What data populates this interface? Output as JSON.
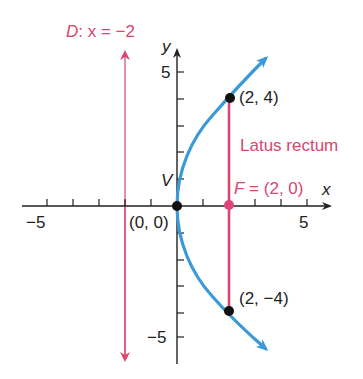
{
  "diagram": {
    "type": "parabola",
    "equation": "y^2 = 8x",
    "colors": {
      "parabola": "#3A9AD9",
      "directrix": "#D9466F",
      "latus_rectum": "#D9466F",
      "axes": "#222222",
      "points": "#111111",
      "focus": "#E0457A"
    },
    "axes": {
      "x_label": "x",
      "y_label": "y",
      "x_tick_labels": {
        "neg": "−5",
        "pos": "5"
      },
      "y_tick_labels": {
        "pos": "5",
        "neg": "−5"
      },
      "x_range": [
        -6,
        6
      ],
      "y_range": [
        -6,
        6
      ]
    },
    "labels": {
      "directrix_prefix": "D",
      "directrix_eq": ": x = −2",
      "vertex_letter": "V",
      "vertex_coords": "(0, 0)",
      "focus_prefix": "F",
      "focus_eq": " = (2, 0)",
      "latus_rectum": "Latus rectum",
      "point_top": "(2, 4)",
      "point_bottom": "(2, −4)"
    },
    "points": [
      {
        "name": "vertex",
        "x": 0,
        "y": 0
      },
      {
        "name": "focus",
        "x": 2,
        "y": 0
      },
      {
        "name": "latus-top",
        "x": 2,
        "y": 4
      },
      {
        "name": "latus-bottom",
        "x": 2,
        "y": -4
      }
    ],
    "directrix_x": -2
  }
}
